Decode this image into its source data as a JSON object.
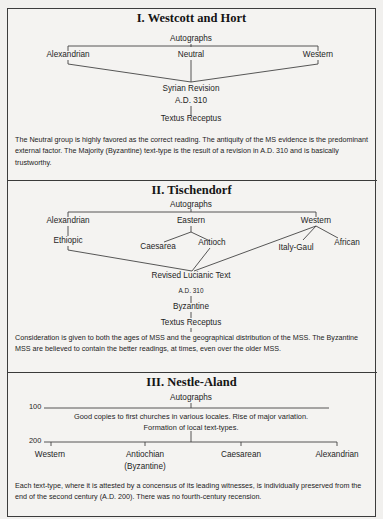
{
  "section1": {
    "title": "I. Westcott and Hort",
    "root": "Autographs",
    "branches": [
      "Alexandrian",
      "Neutral",
      "Western"
    ],
    "merge": "Syrian Revision",
    "merge_date": "A.D. 310",
    "result": "Textus Receptus",
    "description": "The Neutral group is highly favored as the correct reading. The antiquity of the MS evidence is the predominant external factor. The Majority (Byzantine) text-type is the result of a revision in A.D. 310 and is basically trustworthy."
  },
  "section2": {
    "title": "II. Tischendorf",
    "root": "Autographs",
    "branches": [
      "Alexandrian",
      "Eastern",
      "Western"
    ],
    "alexandrian_child": "Ethiopic",
    "eastern_children": [
      "Caesarea",
      "Antioch"
    ],
    "western_children": [
      "Italy-Gaul",
      "African"
    ],
    "merge": "Revised Lucianic Text",
    "merge_date": "A.D. 310",
    "intermediate": "Byzantine",
    "result": "Textus Receptus",
    "description": "Consideration is given to both the ages of MSS and the geographical distribution of the MSS. The Byzantine MSS are believed to contain the better readings, at times, even over the older MSS."
  },
  "section3": {
    "title": "III. Nestle-Aland",
    "root": "Autographs",
    "year_100": "100",
    "year_200": "200",
    "note_line1": "Good copies to first churches in various locales. Rise of major variation.",
    "note_line2": "Formation of local text-types.",
    "text_types": [
      "Western",
      "Antiochian",
      "Caesarean",
      "Alexandrian"
    ],
    "antiochian_sub": "(Byzantine)",
    "description": "Each text-type, where it is attested by a concensus of its leading witnesses, is individually preserved from the end of the second century (A.D. 200). There was no fourth-century recension."
  }
}
